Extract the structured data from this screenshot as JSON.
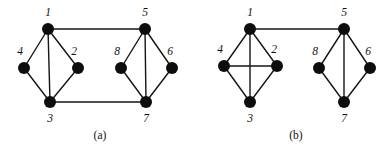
{
  "figure": {
    "width": 392,
    "height": 153,
    "background": "#ffffff",
    "node_color": "#0d0d0d",
    "edge_color": "#151515",
    "node_radius": 6,
    "edge_width": 1.4
  },
  "chart_data": {
    "type": "diagram",
    "title": "",
    "panels": [
      {
        "caption": "(a)",
        "caption_x": 100,
        "caption_y": 136,
        "nodes": [
          {
            "id": "1",
            "label": "1",
            "x": 48,
            "y": 29,
            "label_x": 48,
            "label_y": 13
          },
          {
            "id": "2",
            "label": "2",
            "x": 78,
            "y": 68,
            "label_x": 74,
            "label_y": 52
          },
          {
            "id": "3",
            "label": "3",
            "x": 50,
            "y": 102,
            "label_x": 50,
            "label_y": 119
          },
          {
            "id": "4",
            "label": "4",
            "x": 24,
            "y": 68,
            "label_x": 20,
            "label_y": 52
          },
          {
            "id": "5",
            "label": "5",
            "x": 145,
            "y": 29,
            "label_x": 145,
            "label_y": 13
          },
          {
            "id": "6",
            "label": "6",
            "x": 172,
            "y": 68,
            "label_x": 170,
            "label_y": 52
          },
          {
            "id": "7",
            "label": "7",
            "x": 146,
            "y": 102,
            "label_x": 146,
            "label_y": 119
          },
          {
            "id": "8",
            "label": "8",
            "x": 121,
            "y": 68,
            "label_x": 117,
            "label_y": 52
          }
        ],
        "edges": [
          [
            "1",
            "4"
          ],
          [
            "1",
            "2"
          ],
          [
            "1",
            "3"
          ],
          [
            "4",
            "3"
          ],
          [
            "2",
            "3"
          ],
          [
            "1",
            "5"
          ],
          [
            "3",
            "7"
          ],
          [
            "5",
            "8"
          ],
          [
            "5",
            "6"
          ],
          [
            "5",
            "7"
          ],
          [
            "8",
            "7"
          ],
          [
            "6",
            "7"
          ]
        ]
      },
      {
        "caption": "(b)",
        "caption_x": 296,
        "caption_y": 136,
        "nodes": [
          {
            "id": "1",
            "label": "1",
            "x": 250,
            "y": 29,
            "label_x": 250,
            "label_y": 13
          },
          {
            "id": "2",
            "label": "2",
            "x": 277,
            "y": 66,
            "label_x": 274,
            "label_y": 50
          },
          {
            "id": "3",
            "label": "3",
            "x": 250,
            "y": 102,
            "label_x": 250,
            "label_y": 119
          },
          {
            "id": "4",
            "label": "4",
            "x": 224,
            "y": 66,
            "label_x": 220,
            "label_y": 50
          },
          {
            "id": "5",
            "label": "5",
            "x": 344,
            "y": 29,
            "label_x": 344,
            "label_y": 13
          },
          {
            "id": "6",
            "label": "6",
            "x": 370,
            "y": 68,
            "label_x": 368,
            "label_y": 52
          },
          {
            "id": "7",
            "label": "7",
            "x": 344,
            "y": 102,
            "label_x": 344,
            "label_y": 119
          },
          {
            "id": "8",
            "label": "8",
            "x": 319,
            "y": 68,
            "label_x": 315,
            "label_y": 52
          }
        ],
        "edges": [
          [
            "1",
            "4"
          ],
          [
            "1",
            "2"
          ],
          [
            "1",
            "3"
          ],
          [
            "4",
            "3"
          ],
          [
            "2",
            "3"
          ],
          [
            "4",
            "2"
          ],
          [
            "1",
            "5"
          ],
          [
            "5",
            "8"
          ],
          [
            "5",
            "6"
          ],
          [
            "5",
            "7"
          ],
          [
            "8",
            "7"
          ],
          [
            "6",
            "7"
          ]
        ]
      }
    ]
  }
}
